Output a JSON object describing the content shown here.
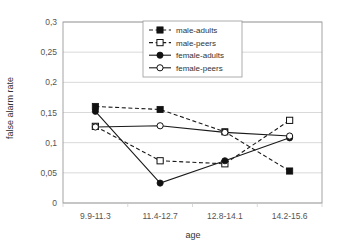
{
  "chart_data": {
    "type": "line",
    "title": "",
    "xlabel": "age",
    "ylabel": "false alarm rate",
    "categories": [
      "9.9-11.3",
      "11.4-12.7",
      "12.8-14.1",
      "14.2-15.6"
    ],
    "ylim": [
      0,
      0.3
    ],
    "yticks": [
      "0",
      "0,05",
      "0,1",
      "0,15",
      "0,2",
      "0,25",
      "0,3"
    ],
    "ytick_values": [
      0,
      0.05,
      0.1,
      0.15,
      0.2,
      0.25,
      0.3
    ],
    "grid": true,
    "legend_position": "top-center",
    "series": [
      {
        "name": "male-adults",
        "values": [
          0.16,
          0.155,
          0.118,
          0.053
        ],
        "line_style": "dashed",
        "marker": "filled-square"
      },
      {
        "name": "male-peers",
        "values": [
          0.127,
          0.07,
          0.065,
          0.137
        ],
        "line_style": "dashed",
        "marker": "open-square"
      },
      {
        "name": "female-adults",
        "values": [
          0.152,
          0.033,
          0.07,
          0.108
        ],
        "line_style": "solid",
        "marker": "filled-circle"
      },
      {
        "name": "female-peers",
        "values": [
          0.126,
          0.128,
          0.117,
          0.111
        ],
        "line_style": "solid",
        "marker": "open-circle"
      }
    ]
  },
  "colors": {
    "series": "#111111",
    "grid": "#c8c8c8",
    "frame": "#9a9a9a",
    "background": "#ffffff"
  }
}
